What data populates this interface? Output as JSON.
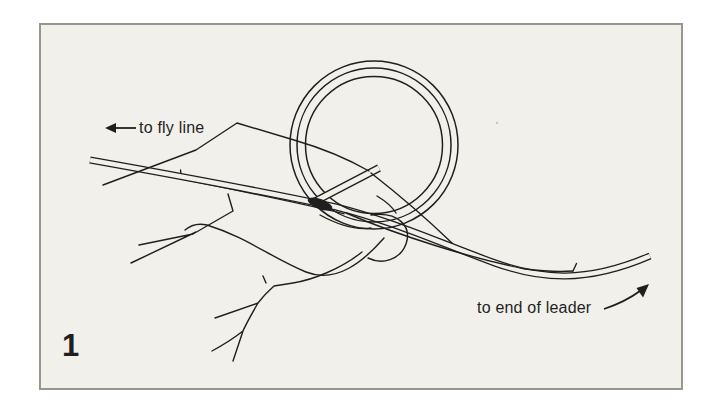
{
  "figure": {
    "number": "1",
    "labels": {
      "fly_line": "to fly line",
      "leader": "to end of leader"
    },
    "colors": {
      "ink": "#1f1f1f",
      "paper": "#f1f0eb",
      "frame_border": "#98968f",
      "page_background": "#ffffff"
    },
    "icons": {
      "fly_line_arrow": "left-arrow",
      "leader_arrow": "up-right-arrow"
    }
  }
}
